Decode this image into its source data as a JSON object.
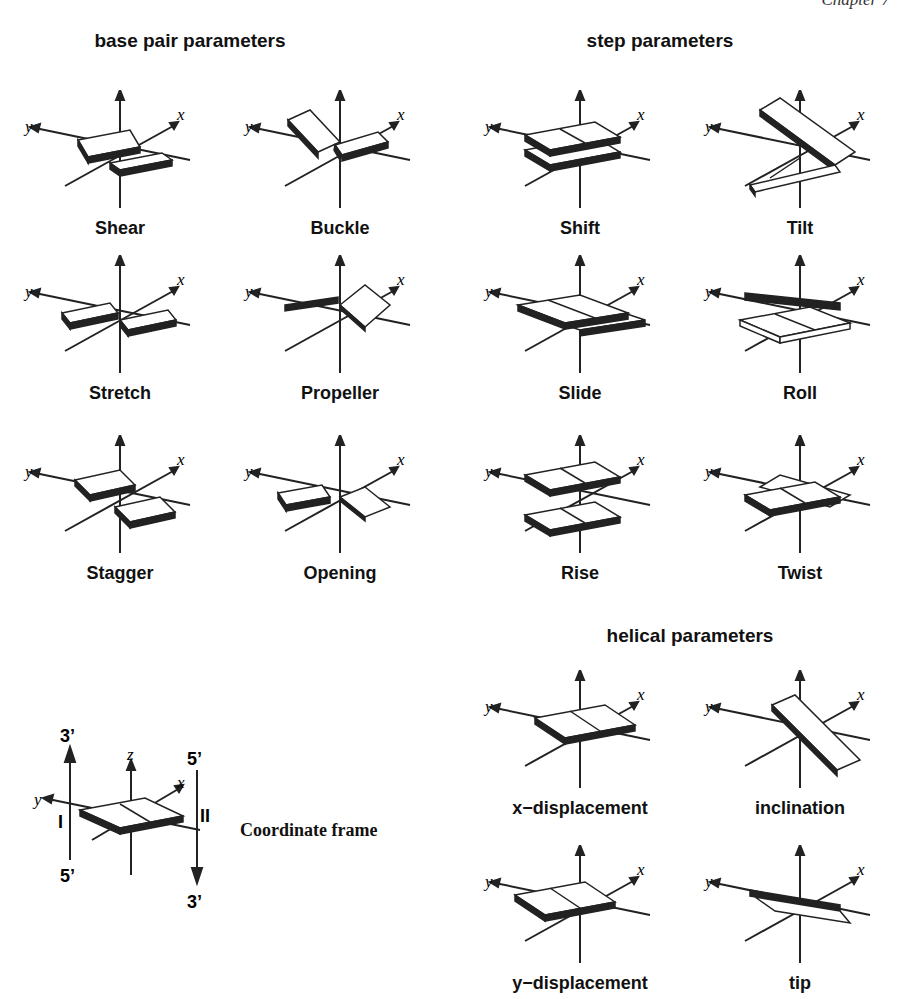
{
  "header": {
    "running_header": "Chapter 7"
  },
  "sections": {
    "base_pair": {
      "title": "base pair parameters"
    },
    "step": {
      "title": "step parameters"
    },
    "helical": {
      "title": "helical parameters"
    }
  },
  "axes": {
    "x": "x",
    "y": "y",
    "z": "z"
  },
  "panels": {
    "shear": "Shear",
    "buckle": "Buckle",
    "stretch": "Stretch",
    "propeller": "Propeller",
    "stagger": "Stagger",
    "opening": "Opening",
    "shift": "Shift",
    "tilt": "Tilt",
    "slide": "Slide",
    "roll": "Roll",
    "rise": "Rise",
    "twist": "Twist",
    "x_displacement": "x−displacement",
    "inclination": "inclination",
    "y_displacement": "y−displacement",
    "tip": "tip"
  },
  "coordinate_frame": {
    "title": "Coordinate frame",
    "strand_I": "I",
    "strand_II": "II",
    "strand_I_top": "3’",
    "strand_I_bottom": "5’",
    "strand_II_top": "5’",
    "strand_II_bottom": "3’"
  }
}
